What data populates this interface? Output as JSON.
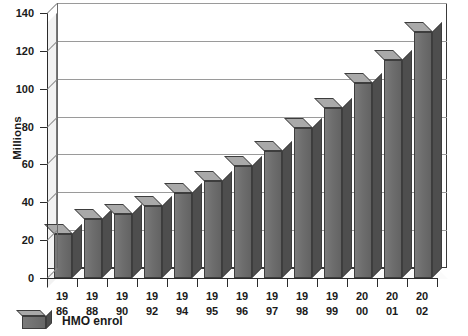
{
  "chart_data": {
    "type": "bar",
    "title": "",
    "subtitle": "",
    "xlabel": "",
    "ylabel": "Millions",
    "categories": [
      "1986",
      "1988",
      "1990",
      "1992",
      "1994",
      "1995",
      "1996",
      "1997",
      "1998",
      "1999",
      "2000",
      "2001",
      "2002"
    ],
    "category_lines": [
      [
        "19",
        "86"
      ],
      [
        "19",
        "88"
      ],
      [
        "19",
        "90"
      ],
      [
        "19",
        "92"
      ],
      [
        "19",
        "94"
      ],
      [
        "19",
        "95"
      ],
      [
        "19",
        "96"
      ],
      [
        "19",
        "97"
      ],
      [
        "19",
        "98"
      ],
      [
        "19",
        "99"
      ],
      [
        "20",
        "00"
      ],
      [
        "20",
        "01"
      ],
      [
        "20",
        "02"
      ]
    ],
    "series": [
      {
        "name": "HMO enrol",
        "values": [
          23,
          31,
          34,
          38,
          45,
          51,
          59,
          67,
          79,
          90,
          103,
          115,
          130
        ]
      }
    ],
    "ylim": [
      0,
      140
    ],
    "yticks": [
      0,
      20,
      40,
      60,
      80,
      100,
      120,
      140
    ],
    "ytick_labels": [
      "0",
      "20",
      "40",
      "60",
      "80",
      "100",
      "120",
      "140"
    ],
    "grid": true,
    "grid_axis": "y",
    "legend_position": "bottom-left",
    "style": "3d-column",
    "colors": {
      "bar_front": "#6e6e6e",
      "bar_top": "#a9a9a9",
      "bar_side": "#4e4e4e",
      "bar_outline": "#3d3d3d",
      "gridline": "#9a9a9a",
      "axis": "#2b2b2b",
      "background": "#ffffff",
      "text": "#1a1a1a"
    }
  },
  "legend": {
    "entries": [
      {
        "label": "HMO enrol",
        "swatch_name": "hmo-enrol-swatch"
      }
    ]
  },
  "axes": {
    "y_title": "Millions"
  }
}
